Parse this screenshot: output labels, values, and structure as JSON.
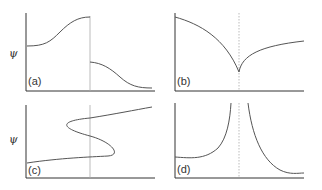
{
  "axis_symbol": "ψ",
  "panels": [
    {
      "id": "a",
      "label": "(a)",
      "description": "Smooth rise to a discontinuity, then jump down and smooth decline"
    },
    {
      "id": "b",
      "label": "(b)",
      "description": "Decreasing to a cusp at the vertical line, then increasing"
    },
    {
      "id": "c",
      "label": "(c)",
      "description": "S-shaped multivalued curve crossing the vertical line three times"
    },
    {
      "id": "d",
      "label": "(d)",
      "description": "Curve diverging to infinity on both sides of the vertical line"
    }
  ],
  "colors": {
    "axis": "#333333",
    "curve": "#555555",
    "guide": "#aaaaaa"
  }
}
